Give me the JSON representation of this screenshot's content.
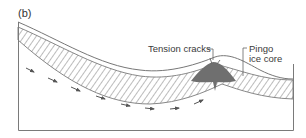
{
  "figure": {
    "panel_label": "(b)",
    "labels": {
      "tension_cracks": "Tension cracks",
      "pingo_line1": "Pingo",
      "pingo_line2": "ice core"
    },
    "elements": [
      "ground-surface",
      "hatched-permafrost-layer",
      "pingo-ice-core",
      "groundwater-flow-arrows",
      "frame"
    ],
    "colors": {
      "line": "#6e6e6e",
      "ice_core": "#6f6f6f",
      "hatch": "#7a7a7a",
      "text": "#3a3a3a",
      "background": "#ffffff"
    }
  }
}
